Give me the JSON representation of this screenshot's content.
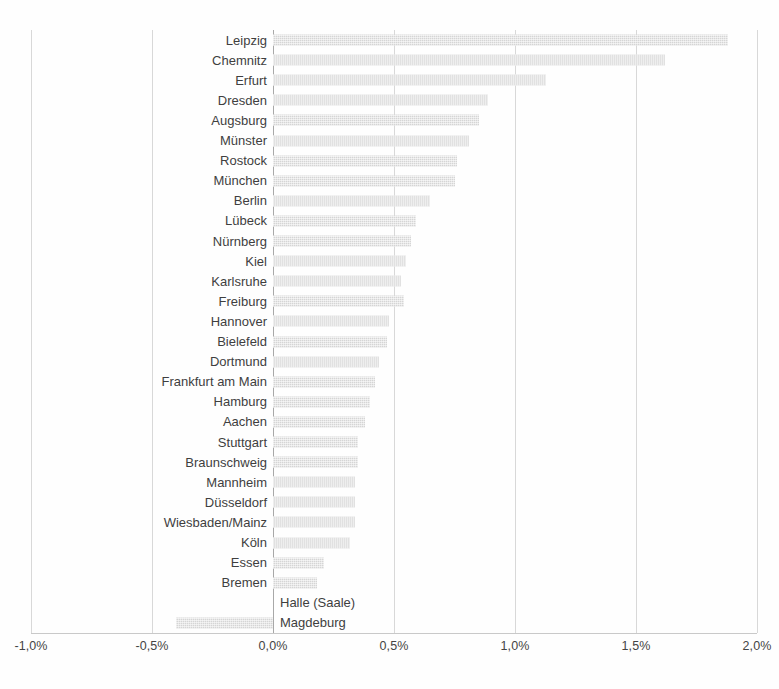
{
  "chart_data": {
    "type": "bar",
    "orientation": "horizontal",
    "title": "",
    "subtitle": "",
    "xlabel": "",
    "ylabel": "",
    "xlim": [
      -1.0,
      2.0
    ],
    "xtick_labels": [
      "-1,0%",
      "-0,5%",
      "0,0%",
      "0,5%",
      "1,0%",
      "1,5%",
      "2,0%"
    ],
    "xticks": [
      -1.0,
      -0.5,
      0.0,
      0.5,
      1.0,
      1.5,
      2.0
    ],
    "unit": "%",
    "grid": true,
    "legend": "none",
    "bar_color": "#d5d5d5",
    "zero_axis_color": "#a8a8a8",
    "gridline_color": "#d8d8d8",
    "categories": [
      "Leipzig",
      "Chemnitz",
      "Erfurt",
      "Dresden",
      "Augsburg",
      "Münster",
      "Rostock",
      "München",
      "Berlin",
      "Lübeck",
      "Nürnberg",
      "Kiel",
      "Karlsruhe",
      "Freiburg",
      "Hannover",
      "Bielefeld",
      "Dortmund",
      "Frankfurt am Main",
      "Hamburg",
      "Aachen",
      "Stuttgart",
      "Braunschweig",
      "Mannheim",
      "Düsseldorf",
      "Wiesbaden/Mainz",
      "Köln",
      "Essen",
      "Bremen",
      "Halle (Saale)",
      "Magdeburg"
    ],
    "values": [
      1.88,
      1.62,
      1.13,
      0.89,
      0.85,
      0.81,
      0.76,
      0.75,
      0.65,
      0.59,
      0.57,
      0.55,
      0.53,
      0.54,
      0.48,
      0.47,
      0.44,
      0.42,
      0.4,
      0.38,
      0.35,
      0.35,
      0.34,
      0.34,
      0.34,
      0.32,
      0.21,
      0.18,
      0.0,
      -0.4
    ]
  }
}
